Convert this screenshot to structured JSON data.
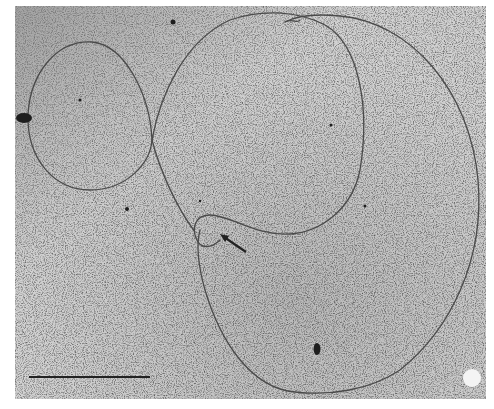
{
  "figure": {
    "type": "electron-micrograph",
    "background_color": "#c9c9c9",
    "filament_color": "#4a4a4a",
    "frame": {
      "x": 15,
      "y": 6,
      "width": 471,
      "height": 393
    }
  },
  "annotations": {
    "arrow": {
      "label": "arrow-marker",
      "from": [
        246,
        252
      ],
      "to": [
        222,
        236
      ]
    },
    "scale_bar": {
      "label": "scale-bar",
      "x1": 29,
      "x2": 150,
      "y": 377
    }
  },
  "particles": [
    {
      "x": 173,
      "y": 22,
      "r": 2.5
    },
    {
      "x": 24,
      "y": 118,
      "rx": 8,
      "ry": 5
    },
    {
      "x": 80,
      "y": 100,
      "r": 1.5
    },
    {
      "x": 127,
      "y": 209,
      "r": 2
    },
    {
      "x": 331,
      "y": 125,
      "r": 1.5
    },
    {
      "x": 365,
      "y": 206,
      "r": 1.5
    },
    {
      "x": 317,
      "y": 349,
      "rx": 3.5,
      "ry": 6
    },
    {
      "x": 200,
      "y": 201,
      "r": 1.2
    }
  ],
  "bright_spot": {
    "x": 472,
    "y": 378,
    "r": 9
  }
}
